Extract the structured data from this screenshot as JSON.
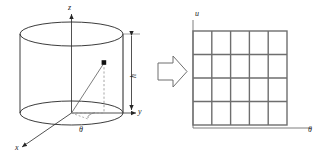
{
  "figure": {
    "background_color": "#ffffff",
    "line_color": "#262626",
    "grid_color": "#6e6e6e",
    "dashed_color": "#8a8a8a",
    "marker_color": "#111111"
  },
  "left_panel": {
    "name": "cylinder-diagram",
    "axes": [
      {
        "id": "z",
        "label": "z",
        "orientation": "vertical-up"
      },
      {
        "id": "y",
        "label": "y",
        "orientation": "horizontal-right"
      },
      {
        "id": "x",
        "label": "x",
        "orientation": "oblique-lower-left"
      }
    ],
    "dimension": {
      "label": "h",
      "description": "cylinder height, measured between the two end ellipses"
    },
    "angle": {
      "label": "θ",
      "description": "azimuthal angle measured in the base plane"
    },
    "point": {
      "label": "",
      "description": "sample point on the cylinder surface"
    },
    "cylinder": {
      "top_ellipse": {
        "cx": 71.5,
        "cy": 34,
        "rx": 51.5,
        "ry": 12
      },
      "bottom_ellipse": {
        "cx": 71.5,
        "cy": 113,
        "rx": 51.5,
        "ry": 12
      }
    }
  },
  "arrow": {
    "name": "maps-to-arrow",
    "direction": "right",
    "style": "hollow-block"
  },
  "right_panel": {
    "name": "parameter-grid",
    "axes": [
      {
        "id": "u",
        "label": "u",
        "orientation": "vertical-up"
      },
      {
        "id": "theta",
        "label": "θ",
        "orientation": "horizontal-right"
      }
    ],
    "grid": {
      "columns": 5,
      "rows": 4,
      "x0": 193,
      "y0": 31,
      "x1": 287,
      "y1": 125
    }
  }
}
